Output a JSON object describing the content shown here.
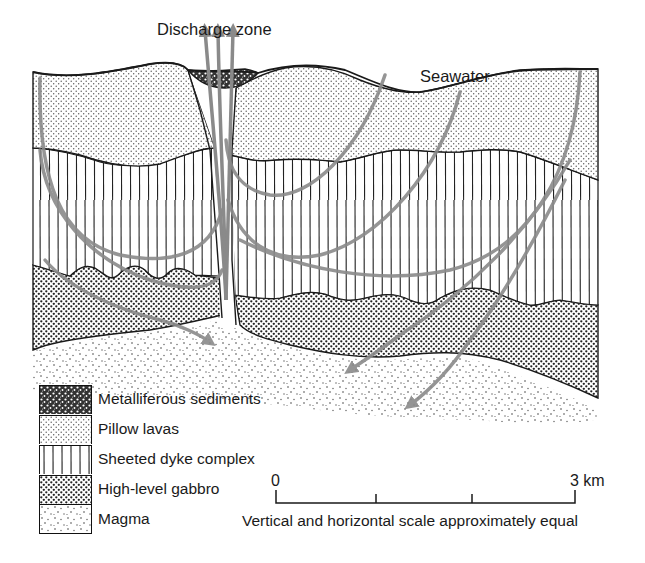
{
  "labels": {
    "discharge_zone": "Discharge zone",
    "seawater": "Seawater"
  },
  "legend": {
    "items": [
      {
        "key": "metalliferous",
        "label": "Metalliferous sediments",
        "pattern": "dense-dark-speckle"
      },
      {
        "key": "pillow_lavas",
        "label": "Pillow lavas",
        "pattern": "fine-regular-dots"
      },
      {
        "key": "sheeted_dyke",
        "label": "Sheeted dyke complex",
        "pattern": "vertical-lines"
      },
      {
        "key": "gabbro",
        "label": "High-level gabbro",
        "pattern": "dense-coarse-dots"
      },
      {
        "key": "magma",
        "label": "Magma",
        "pattern": "sparse-random-dots"
      }
    ]
  },
  "scale_bar": {
    "start_label": "0",
    "end_label": "3 km",
    "ticks": 4,
    "caption": "Vertical and horizontal scale approximately equal"
  },
  "colors": {
    "ink": "#1a1a1a",
    "flow_arrow": "#8a8a8a",
    "background": "#ffffff"
  }
}
